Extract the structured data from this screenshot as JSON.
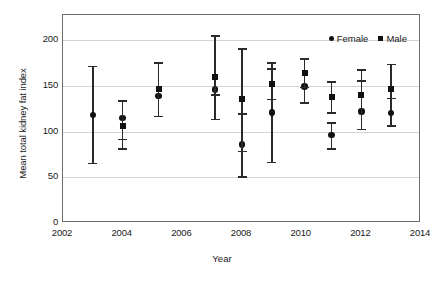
{
  "chart_data": {
    "type": "scatter",
    "title": "",
    "xlabel": "Year",
    "ylabel": "Mean total kidney fat index",
    "xlim": [
      2002,
      2014
    ],
    "ylim": [
      0,
      215
    ],
    "xticks": [
      2002,
      2004,
      2006,
      2008,
      2010,
      2012,
      2014
    ],
    "yticks": [
      0,
      50,
      100,
      150,
      200
    ],
    "grid": "horizontal",
    "legend_position": "top-right",
    "legend": [
      {
        "name": "Female",
        "marker": "circle"
      },
      {
        "name": "Male",
        "marker": "square"
      }
    ],
    "error_bars": "vertical, capped",
    "series": [
      {
        "name": "Female",
        "marker": "circle",
        "points": [
          {
            "x": 2003.0,
            "y": 118,
            "low": 66,
            "high": 172
          },
          {
            "x": 2004.0,
            "y": 115,
            "low": 92,
            "high": 134
          },
          {
            "x": 2005.2,
            "y": 139,
            "low": 117,
            "high": 176
          },
          {
            "x": 2007.1,
            "y": 146,
            "low": 114,
            "high": 205
          },
          {
            "x": 2008.0,
            "y": 86,
            "low": 51,
            "high": 120
          },
          {
            "x": 2009.0,
            "y": 121,
            "low": 67,
            "high": 169
          },
          {
            "x": 2010.1,
            "y": 149,
            "low": 132,
            "high": 180
          },
          {
            "x": 2011.0,
            "y": 96,
            "low": 82,
            "high": 110
          },
          {
            "x": 2012.0,
            "y": 122,
            "low": 103,
            "high": 156
          },
          {
            "x": 2013.0,
            "y": 120,
            "low": 107,
            "high": 137
          }
        ]
      },
      {
        "name": "Male",
        "marker": "square",
        "points": [
          {
            "x": 2004.0,
            "y": 106,
            "low": 82,
            "high": 134
          },
          {
            "x": 2005.2,
            "y": 146,
            "low": 117,
            "high": 176
          },
          {
            "x": 2007.1,
            "y": 160,
            "low": 141,
            "high": 205
          },
          {
            "x": 2008.0,
            "y": 136,
            "low": 79,
            "high": 191
          },
          {
            "x": 2009.0,
            "y": 152,
            "low": 136,
            "high": 176
          },
          {
            "x": 2010.1,
            "y": 164,
            "low": 149,
            "high": 180
          },
          {
            "x": 2011.0,
            "y": 138,
            "low": 121,
            "high": 155
          },
          {
            "x": 2012.0,
            "y": 140,
            "low": 103,
            "high": 168
          },
          {
            "x": 2013.0,
            "y": 146,
            "low": 137,
            "high": 174
          }
        ]
      }
    ]
  },
  "axis": {
    "y_title": "Mean total kidney fat index",
    "x_title": "Year",
    "y_tick_labels": [
      "200",
      "150",
      "100",
      "50",
      "0"
    ],
    "x_tick_labels": [
      "2002",
      "2004",
      "2006",
      "2008",
      "2010",
      "2012",
      "2014"
    ]
  },
  "legend": {
    "female_label": "Female",
    "male_label": "Male"
  },
  "colors": {
    "marker": "#111111",
    "error_bar": "#2a2a2a",
    "gridline": "#d4d4d4",
    "frame": "#6e6e6e",
    "background": "#ffffff",
    "text": "#1a1a1a"
  }
}
